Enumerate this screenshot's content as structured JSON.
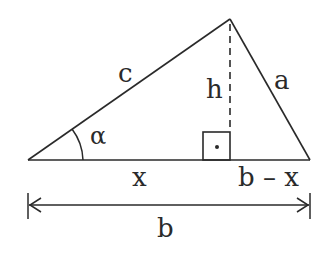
{
  "diagram": {
    "type": "triangle-height-decomposition",
    "labels": {
      "side_c": "c",
      "side_a": "a",
      "height": "h",
      "angle_alpha": "α",
      "segment_x": "x",
      "segment_b_minus_x": "b – x",
      "base_b": "b"
    },
    "right_angle_mark": "·",
    "colors": {
      "stroke": "#2a2a2a",
      "background": "#ffffff"
    }
  }
}
